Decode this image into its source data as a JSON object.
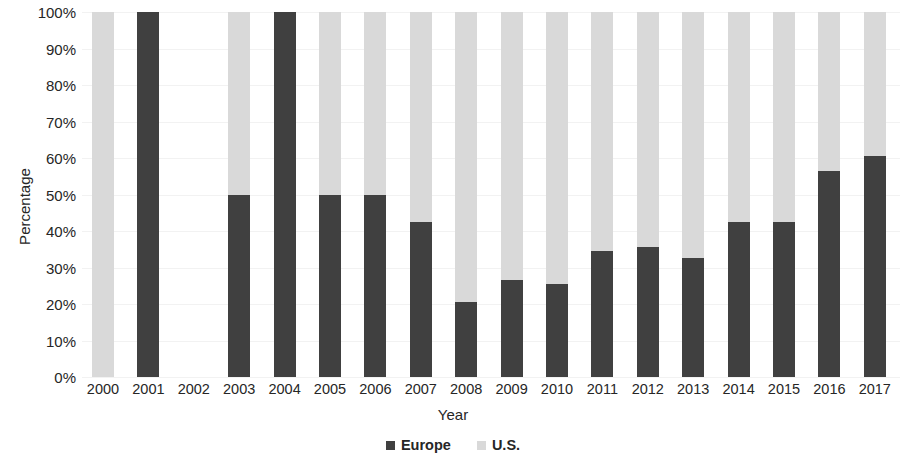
{
  "chart_data": {
    "type": "bar",
    "subtype": "stacked-100-percent",
    "title": "",
    "xlabel": "Year",
    "ylabel": "Percentage",
    "ylim": [
      0,
      100
    ],
    "grid": true,
    "legend_position": "bottom",
    "categories": [
      "2000",
      "2001",
      "2002",
      "2003",
      "2004",
      "2005",
      "2006",
      "2007",
      "2008",
      "2009",
      "2010",
      "2011",
      "2012",
      "2013",
      "2014",
      "2015",
      "2016",
      "2017"
    ],
    "y_ticks": [
      "0%",
      "10%",
      "20%",
      "30%",
      "40%",
      "50%",
      "60%",
      "70%",
      "80%",
      "90%",
      "100%"
    ],
    "y_tick_values": [
      0,
      10,
      20,
      30,
      40,
      50,
      60,
      70,
      80,
      90,
      100
    ],
    "series": [
      {
        "name": "Europe",
        "color": "#404040",
        "values": [
          0,
          100,
          null,
          50,
          100,
          50,
          50,
          42.5,
          20.5,
          26.5,
          25.5,
          34.5,
          35.5,
          32.5,
          42.5,
          42.5,
          56.5,
          60.5
        ]
      },
      {
        "name": "U.S.",
        "color": "#d9d9d9",
        "values": [
          100,
          0,
          null,
          50,
          0,
          50,
          50,
          57.5,
          79.5,
          73.5,
          74.5,
          65.5,
          64.5,
          67.5,
          57.5,
          57.5,
          43.5,
          39.5
        ]
      }
    ]
  },
  "legend": {
    "items": [
      {
        "label": "Europe",
        "color": "#404040",
        "swatch_name": "legend-swatch-europe"
      },
      {
        "label": "U.S.",
        "color": "#d9d9d9",
        "swatch_name": "legend-swatch-us"
      }
    ]
  }
}
